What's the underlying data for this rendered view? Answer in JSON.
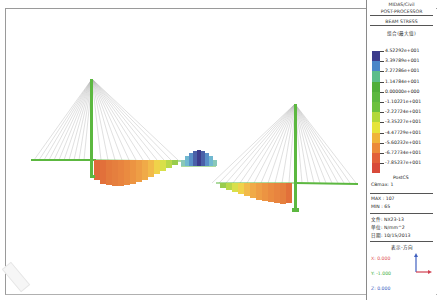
{
  "legend": {
    "app_line1": "MIDAS/Civil",
    "app_line2": "POST-PROCESSOR",
    "result_type": "BEAM STRESS",
    "component": "组合(最大值)",
    "scale": [
      {
        "value": "4.52292e+001",
        "color": "#3c3c8c"
      },
      {
        "value": "3.39789e+001",
        "color": "#4a86c8"
      },
      {
        "value": "2.27286e+001",
        "color": "#5bbd8a"
      },
      {
        "value": "1.14784e+001",
        "color": "#4fae3a"
      },
      {
        "value": "0.00000e+000",
        "color": "#5cb840"
      },
      {
        "value": "-1.10221e+001",
        "color": "#6cc13e"
      },
      {
        "value": "-2.22724e+001",
        "color": "#b2d83a"
      },
      {
        "value": "-3.35227e+001",
        "color": "#e6e43a"
      },
      {
        "value": "-4.47729e+001",
        "color": "#f0b43a"
      },
      {
        "value": "-5.60232e+001",
        "color": "#ec8a3a"
      },
      {
        "value": "-6.72734e+001",
        "color": "#e2603a"
      },
      {
        "value": "-7.85237e+001",
        "color": "#d84a3a"
      }
    ],
    "stage": "PostCS",
    "cb_label": "CBmax: 1",
    "max": "MAX : 107",
    "min": "MIN : 65",
    "file": "文件: NX23-13",
    "unit": "单位: N/mm^2",
    "date": "日期: 10/15/2013",
    "view_dir_title": "表示-方向",
    "x": "X: 0.000",
    "y": "Y: -1.000",
    "z": "Z: 0.000"
  },
  "colors": {
    "tower": "#5cb840",
    "cable": "#a8a8a8",
    "deck": "#5cb840"
  }
}
